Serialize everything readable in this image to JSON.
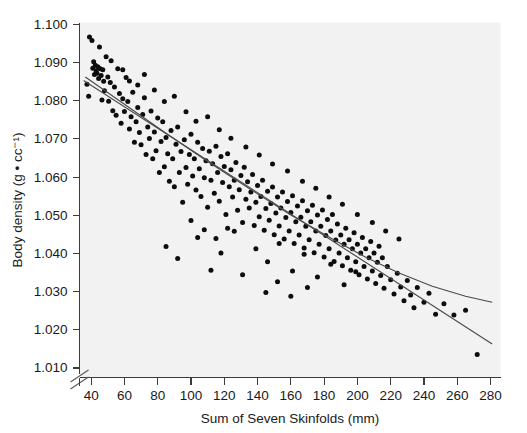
{
  "chart_data": {
    "type": "scatter",
    "title": "",
    "xlabel": "Sum of Seven Skinfolds (mm)",
    "ylabel": "Body density (g • cc⁻¹)",
    "xlim": [
      33,
      286
    ],
    "ylim": [
      1.0075,
      1.1005
    ],
    "xticks": [
      40,
      60,
      80,
      100,
      120,
      140,
      160,
      180,
      200,
      220,
      240,
      260,
      280
    ],
    "yticks": [
      1.01,
      1.02,
      1.03,
      1.04,
      1.05,
      1.06,
      1.07,
      1.08,
      1.09,
      1.1
    ],
    "xtick_labels": [
      "40",
      "60",
      "80",
      "100",
      "120",
      "140",
      "160",
      "180",
      "200",
      "220",
      "240",
      "260",
      "280"
    ],
    "ytick_labels": [
      "1.010",
      "1.020",
      "1.030",
      "1.040",
      "1.050",
      "1.060",
      "1.070",
      "1.080",
      "1.090",
      "1.100"
    ],
    "grid": false,
    "legend": null,
    "axis_break": {
      "axis": "y",
      "symbol": "double-slash",
      "note": "y-axis broken below 1.010"
    },
    "marker": {
      "shape": "circle",
      "color": "#0d0d0d",
      "size_px": 5
    },
    "series": [
      {
        "name": "Body density vs sum of seven skinfolds",
        "points": [
          [
            37.5,
            1.0843
          ],
          [
            38.5,
            1.0812
          ],
          [
            39.0,
            1.0967
          ],
          [
            40.5,
            1.0958
          ],
          [
            41.0,
            1.0885
          ],
          [
            41.5,
            1.0902
          ],
          [
            42.0,
            1.0869
          ],
          [
            42.5,
            1.0893
          ],
          [
            43.0,
            1.0878
          ],
          [
            43.5,
            1.0872
          ],
          [
            44.0,
            1.0889
          ],
          [
            44.5,
            1.0858
          ],
          [
            45.0,
            1.0941
          ],
          [
            45.5,
            1.0884
          ],
          [
            46.0,
            1.0866
          ],
          [
            46.5,
            1.0802
          ],
          [
            47.0,
            1.0881
          ],
          [
            47.5,
            1.0851
          ],
          [
            48.0,
            1.0826
          ],
          [
            49.0,
            1.0915
          ],
          [
            50.0,
            1.0862
          ],
          [
            50.5,
            1.0799
          ],
          [
            51.5,
            1.0848
          ],
          [
            52.0,
            1.0905
          ],
          [
            53.0,
            1.0774
          ],
          [
            54.0,
            1.0836
          ],
          [
            55.0,
            1.0762
          ],
          [
            56.0,
            1.0884
          ],
          [
            57.0,
            1.0819
          ],
          [
            58.0,
            1.0741
          ],
          [
            59.0,
            1.0805
          ],
          [
            60.0,
            1.0772
          ],
          [
            61.0,
            1.0861
          ],
          [
            62.0,
            1.0798
          ],
          [
            63.0,
            1.0726
          ],
          [
            64.0,
            1.0758
          ],
          [
            65.0,
            1.0822
          ],
          [
            66.0,
            1.0691
          ],
          [
            67.0,
            1.0745
          ],
          [
            68.0,
            1.0782
          ],
          [
            69.0,
            1.0717
          ],
          [
            70.0,
            1.0685
          ],
          [
            71.0,
            1.0764
          ],
          [
            72.0,
            1.0808
          ],
          [
            73.0,
            1.0659
          ],
          [
            74.0,
            1.0731
          ],
          [
            75.0,
            1.0701
          ],
          [
            76.0,
            1.0773
          ],
          [
            77.0,
            1.0648
          ],
          [
            78.0,
            1.0718
          ],
          [
            79.0,
            1.0669
          ],
          [
            80.0,
            1.0755
          ],
          [
            81.0,
            1.0612
          ],
          [
            82.0,
            1.0693
          ],
          [
            83.0,
            1.0745
          ],
          [
            84.0,
            1.0627
          ],
          [
            85.0,
            1.0704
          ],
          [
            86.0,
            1.0661
          ],
          [
            87.0,
            1.0589
          ],
          [
            88.0,
            1.0722
          ],
          [
            89.0,
            1.0648
          ],
          [
            90.0,
            1.0575
          ],
          [
            91.0,
            1.0686
          ],
          [
            92.0,
            1.0731
          ],
          [
            93.0,
            1.0612
          ],
          [
            94.0,
            1.0667
          ],
          [
            95.0,
            1.0534
          ],
          [
            96.0,
            1.0698
          ],
          [
            97.0,
            1.0625
          ],
          [
            98.0,
            1.0581
          ],
          [
            99.0,
            1.0659
          ],
          [
            100.0,
            1.0712
          ],
          [
            101.0,
            1.0603
          ],
          [
            102.0,
            1.0648
          ],
          [
            103.0,
            1.0566
          ],
          [
            104.0,
            1.0691
          ],
          [
            105.0,
            1.0622
          ],
          [
            106.0,
            1.0549
          ],
          [
            107.0,
            1.0675
          ],
          [
            108.0,
            1.0598
          ],
          [
            109.0,
            1.0643
          ],
          [
            110.0,
            1.0521
          ],
          [
            111.0,
            1.0668
          ],
          [
            112.0,
            1.0592
          ],
          [
            113.0,
            1.0635
          ],
          [
            114.0,
            1.0558
          ],
          [
            115.0,
            1.0681
          ],
          [
            116.0,
            1.0612
          ],
          [
            117.0,
            1.0537
          ],
          [
            118.0,
            1.0654
          ],
          [
            119.0,
            1.0586
          ],
          [
            120.0,
            1.0628
          ],
          [
            121.0,
            1.0502
          ],
          [
            122.0,
            1.0661
          ],
          [
            123.0,
            1.0575
          ],
          [
            124.0,
            1.0619
          ],
          [
            125.0,
            1.0548
          ],
          [
            126.0,
            1.0592
          ],
          [
            127.0,
            1.0638
          ],
          [
            128.0,
            1.0513
          ],
          [
            129.0,
            1.0567
          ],
          [
            130.0,
            1.0604
          ],
          [
            131.0,
            1.0481
          ],
          [
            132.0,
            1.0626
          ],
          [
            133.0,
            1.0542
          ],
          [
            134.0,
            1.0588
          ],
          [
            135.0,
            1.0519
          ],
          [
            136.0,
            1.0561
          ],
          [
            137.0,
            1.0607
          ],
          [
            138.0,
            1.0473
          ],
          [
            139.0,
            1.0534
          ],
          [
            140.0,
            1.0578
          ],
          [
            141.0,
            1.0496
          ],
          [
            142.0,
            1.0549
          ],
          [
            143.0,
            1.0592
          ],
          [
            144.0,
            1.0461
          ],
          [
            145.0,
            1.0518
          ],
          [
            146.0,
            1.0563
          ],
          [
            147.0,
            1.0487
          ],
          [
            148.0,
            1.0531
          ],
          [
            149.0,
            1.0574
          ],
          [
            150.0,
            1.0449
          ],
          [
            151.0,
            1.0506
          ],
          [
            152.0,
            1.0548
          ],
          [
            153.0,
            1.0472
          ],
          [
            154.0,
            1.0519
          ],
          [
            155.0,
            1.0561
          ],
          [
            156.0,
            1.0438
          ],
          [
            157.0,
            1.0494
          ],
          [
            158.0,
            1.0536
          ],
          [
            159.0,
            1.0459
          ],
          [
            160.0,
            1.0507
          ],
          [
            161.0,
            1.0551
          ],
          [
            162.0,
            1.0426
          ],
          [
            163.0,
            1.0483
          ],
          [
            164.0,
            1.0524
          ],
          [
            165.0,
            1.0448
          ],
          [
            166.0,
            1.0495
          ],
          [
            167.0,
            1.0538
          ],
          [
            168.0,
            1.0414
          ],
          [
            169.0,
            1.0471
          ],
          [
            170.0,
            1.0512
          ],
          [
            171.0,
            1.0436
          ],
          [
            172.0,
            1.0483
          ],
          [
            173.0,
            1.0526
          ],
          [
            174.0,
            1.0402
          ],
          [
            175.0,
            1.0459
          ],
          [
            176.0,
            1.0501
          ],
          [
            177.0,
            1.0424
          ],
          [
            178.0,
            1.0471
          ],
          [
            179.0,
            1.0514
          ],
          [
            180.0,
            1.0391
          ],
          [
            181.0,
            1.0447
          ],
          [
            182.0,
            1.0489
          ],
          [
            183.0,
            1.0412
          ],
          [
            184.0,
            1.0459
          ],
          [
            185.0,
            1.0502
          ],
          [
            186.0,
            1.0379
          ],
          [
            187.0,
            1.0435
          ],
          [
            188.0,
            1.0477
          ],
          [
            189.0,
            1.0401
          ],
          [
            190.0,
            1.0448
          ],
          [
            191.0,
            1.0368
          ],
          [
            192.0,
            1.0424
          ],
          [
            193.0,
            1.0466
          ],
          [
            194.0,
            1.0389
          ],
          [
            195.0,
            1.0436
          ],
          [
            196.0,
            1.0356
          ],
          [
            197.0,
            1.0412
          ],
          [
            198.0,
            1.0454
          ],
          [
            199.0,
            1.0378
          ],
          [
            200.0,
            1.0424
          ],
          [
            201.0,
            1.0344
          ],
          [
            202.0,
            1.0401
          ],
          [
            203.0,
            1.0442
          ],
          [
            204.0,
            1.0366
          ],
          [
            205.0,
            1.0412
          ],
          [
            206.0,
            1.0333
          ],
          [
            207.0,
            1.0389
          ],
          [
            208.0,
            1.0431
          ],
          [
            209.0,
            1.0354
          ],
          [
            210.0,
            1.0401
          ],
          [
            211.0,
            1.0321
          ],
          [
            212.0,
            1.0377
          ],
          [
            213.0,
            1.0419
          ],
          [
            214.0,
            1.0342
          ],
          [
            215.0,
            1.0389
          ],
          [
            216.0,
            1.0309
          ],
          [
            218.0,
            1.0366
          ],
          [
            220.0,
            1.0331
          ],
          [
            222.0,
            1.0294
          ],
          [
            224.0,
            1.0348
          ],
          [
            226.0,
            1.0312
          ],
          [
            228.0,
            1.0276
          ],
          [
            230.0,
            1.0329
          ],
          [
            232.0,
            1.0291
          ],
          [
            234.0,
            1.0258
          ],
          [
            236.0,
            1.0311
          ],
          [
            240.0,
            1.0272
          ],
          [
            243.0,
            1.0296
          ],
          [
            247.0,
            1.0241
          ],
          [
            252.0,
            1.0268
          ],
          [
            258.0,
            1.0239
          ],
          [
            265.0,
            1.0251
          ],
          [
            272.0,
            1.0135
          ],
          [
            85.0,
            1.0418
          ],
          [
            92.0,
            1.0387
          ],
          [
            104.0,
            1.0442
          ],
          [
            112.0,
            1.0356
          ],
          [
            118.0,
            1.0401
          ],
          [
            126.0,
            1.0458
          ],
          [
            131.0,
            1.0344
          ],
          [
            139.0,
            1.0412
          ],
          [
            146.0,
            1.0378
          ],
          [
            153.0,
            1.0426
          ],
          [
            161.0,
            1.0354
          ],
          [
            168.0,
            1.0398
          ],
          [
            176.0,
            1.0338
          ],
          [
            184.0,
            1.0372
          ],
          [
            192.0,
            1.0318
          ],
          [
            199.0,
            1.0352
          ],
          [
            59.0,
            1.0881
          ],
          [
            63.0,
            1.0852
          ],
          [
            68.0,
            1.0841
          ],
          [
            72.0,
            1.0869
          ],
          [
            78.0,
            1.0828
          ],
          [
            84.0,
            1.0798
          ],
          [
            90.0,
            1.0812
          ],
          [
            97.0,
            1.0771
          ],
          [
            103.0,
            1.0746
          ],
          [
            110.0,
            1.0758
          ],
          [
            117.0,
            1.0724
          ],
          [
            124.0,
            1.0702
          ],
          [
            133.0,
            1.0679
          ],
          [
            141.0,
            1.0658
          ],
          [
            149.0,
            1.0634
          ],
          [
            158.0,
            1.0616
          ],
          [
            167.0,
            1.0589
          ],
          [
            175.0,
            1.0571
          ],
          [
            183.0,
            1.0548
          ],
          [
            191.0,
            1.0529
          ],
          [
            200.0,
            1.0502
          ],
          [
            209.0,
            1.0481
          ],
          [
            217.0,
            1.0459
          ],
          [
            225.0,
            1.0438
          ],
          [
            145.0,
            1.0298
          ],
          [
            152.0,
            1.0326
          ],
          [
            160.0,
            1.0288
          ],
          [
            170.0,
            1.0311
          ],
          [
            100.0,
            1.0486
          ],
          [
            108.0,
            1.0462
          ],
          [
            115.0,
            1.0439
          ],
          [
            122.0,
            1.0466
          ]
        ]
      }
    ],
    "fits": [
      {
        "name": "linear-regression",
        "type": "line",
        "endpoints": [
          [
            35.5,
            1.0853
          ],
          [
            281.0,
            1.0163
          ]
        ]
      },
      {
        "name": "quadratic-fit",
        "type": "curve",
        "points": [
          [
            36.5,
            1.0862
          ],
          [
            60.0,
            1.0791
          ],
          [
            85.0,
            1.0715
          ],
          [
            110.0,
            1.0641
          ],
          [
            135.0,
            1.057
          ],
          [
            160.0,
            1.0501
          ],
          [
            185.0,
            1.0438
          ],
          [
            205.0,
            1.039
          ],
          [
            225.0,
            1.0349
          ],
          [
            245.0,
            1.0314
          ],
          [
            265.0,
            1.0288
          ],
          [
            281.0,
            1.0272
          ]
        ]
      }
    ]
  },
  "figure": {
    "background_color": "#ffffff",
    "plot_background_color": "#f2f2f2",
    "axis_color": "#3b3b3b",
    "marker_color": "#0d0d0d",
    "fit_line_color": "#4a4a4a"
  }
}
